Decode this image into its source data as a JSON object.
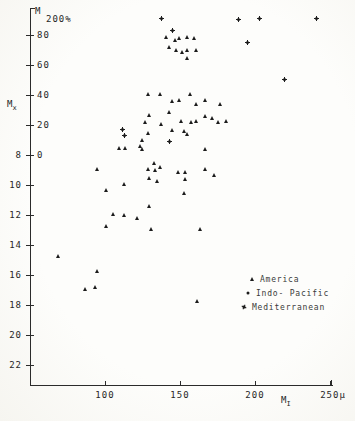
{
  "figure": {
    "title_m": "M",
    "title_pct": "200%",
    "y_outer_label_main": "M",
    "y_outer_label_sub": "x",
    "x_axis_label_main": "M",
    "x_axis_label_sub": "I"
  },
  "chart_data": {
    "type": "scatter",
    "title": "M 200%",
    "x_axis": {
      "label": "M I",
      "unit": "μ",
      "ticks": [
        {
          "value": 100,
          "label": "100"
        },
        {
          "value": 150,
          "label": "150"
        },
        {
          "value": 200,
          "label": "200"
        },
        {
          "value": 250,
          "label": "250μ"
        }
      ],
      "range": [
        50,
        252
      ]
    },
    "y_axis_inner": {
      "label": "M 200%",
      "ticks": [
        {
          "value": 80,
          "label": "80"
        },
        {
          "value": 60,
          "label": "60"
        },
        {
          "value": 40,
          "label": "40"
        },
        {
          "value": 20,
          "label": "20"
        },
        {
          "value": 0,
          "label": "0"
        }
      ]
    },
    "y_axis_outer": {
      "label": "M x",
      "ticks": [
        {
          "value": 8,
          "label": "8"
        },
        {
          "value": 10,
          "label": "10"
        },
        {
          "value": 12,
          "label": "12"
        },
        {
          "value": 14,
          "label": "14"
        },
        {
          "value": 16,
          "label": "16"
        },
        {
          "value": 18,
          "label": "18"
        },
        {
          "value": 20,
          "label": "20"
        },
        {
          "value": 22,
          "label": "22"
        }
      ]
    },
    "calibration": {
      "x0_px": 105,
      "x0_val": 100,
      "px_per_x": 1.5,
      "y0_px": 155,
      "y0_val": 0,
      "px_per_y": 1.5,
      "outer_y8_px": 155,
      "outer_px_per_unit": 15
    },
    "ink_color": "#1c1c1c",
    "legend": [
      {
        "name": "America",
        "marker": "triangle"
      },
      {
        "name": "Indo- Pacific",
        "marker": "dot"
      },
      {
        "name": "Mediterranean",
        "marker": "star"
      }
    ],
    "series": [
      {
        "name": "America",
        "marker": "triangle",
        "points": [
          [
            139,
            93
          ],
          [
            145,
            91
          ],
          [
            148,
            92
          ],
          [
            153,
            93
          ],
          [
            158,
            92
          ],
          [
            141,
            86
          ],
          [
            146,
            84
          ],
          [
            150,
            83
          ],
          [
            153,
            84
          ],
          [
            159,
            84
          ],
          [
            153,
            79
          ],
          [
            127,
            55
          ],
          [
            135,
            55
          ],
          [
            143,
            50
          ],
          [
            148,
            51
          ],
          [
            155,
            55
          ],
          [
            159,
            48
          ],
          [
            165,
            51
          ],
          [
            175,
            48
          ],
          [
            141,
            43
          ],
          [
            128,
            41
          ],
          [
            125,
            36
          ],
          [
            136,
            35
          ],
          [
            149,
            37
          ],
          [
            156,
            36
          ],
          [
            159,
            37
          ],
          [
            165,
            40
          ],
          [
            170,
            39
          ],
          [
            174,
            36
          ],
          [
            179,
            37
          ],
          [
            143,
            31
          ],
          [
            151,
            30
          ],
          [
            153,
            28
          ],
          [
            127,
            29
          ],
          [
            123,
            24
          ],
          [
            122,
            20
          ],
          [
            165,
            18
          ],
          [
            108,
            19
          ],
          [
            112,
            19
          ],
          [
            123,
            18
          ],
          [
            93,
            5
          ],
          [
            131,
            9
          ],
          [
            127,
            5
          ],
          [
            132,
            4
          ],
          [
            135,
            6
          ],
          [
            128,
            -1
          ],
          [
            133,
            -3
          ],
          [
            147,
            3
          ],
          [
            152,
            3
          ],
          [
            152,
            -2
          ],
          [
            165,
            5
          ],
          [
            171,
            1
          ],
          [
            111,
            -5
          ],
          [
            99,
            -9
          ],
          [
            151,
            -11
          ],
          [
            128,
            -20
          ],
          [
            104,
            -25
          ],
          [
            111,
            -26
          ],
          [
            120,
            -28
          ],
          [
            99,
            -33
          ],
          [
            129,
            -35
          ],
          [
            162,
            -35
          ],
          [
            67,
            -53
          ],
          [
            93,
            -63
          ],
          [
            92,
            -74
          ],
          [
            85,
            -75
          ],
          [
            160,
            -83
          ]
        ]
      },
      {
        "name": "Indo- Pacific",
        "marker": "dot",
        "points": [
          [
            162,
            90
          ],
          [
            142,
            87
          ],
          [
            154,
            82
          ],
          [
            122,
            79
          ],
          [
            139,
            77
          ],
          [
            153,
            81
          ],
          [
            172,
            78
          ],
          [
            126,
            75
          ],
          [
            141,
            74
          ],
          [
            145,
            62
          ],
          [
            151,
            61
          ],
          [
            162,
            61
          ],
          [
            139,
            54
          ],
          [
            145,
            49
          ],
          [
            161,
            47
          ],
          [
            167,
            51
          ],
          [
            181,
            46
          ],
          [
            198,
            45
          ],
          [
            198,
            43
          ],
          [
            211,
            36
          ],
          [
            139,
            45
          ],
          [
            130,
            35
          ],
          [
            139,
            37
          ],
          [
            153,
            38
          ],
          [
            162,
            39
          ],
          [
            166,
            37
          ],
          [
            172,
            38
          ],
          [
            185,
            37
          ],
          [
            145,
            31
          ],
          [
            148,
            32
          ],
          [
            156,
            31
          ],
          [
            129,
            27
          ],
          [
            128,
            22
          ],
          [
            141,
            25
          ],
          [
            148,
            25
          ],
          [
            125,
            17
          ],
          [
            119,
            3
          ],
          [
            133,
            10
          ],
          [
            129,
            3
          ],
          [
            131,
            0
          ],
          [
            145,
            2
          ],
          [
            149,
            2
          ],
          [
            151,
            -1
          ],
          [
            149,
            -9
          ],
          [
            153,
            -14
          ],
          [
            139,
            -15
          ],
          [
            109,
            -21
          ],
          [
            132,
            -19
          ],
          [
            122,
            -33
          ],
          [
            181,
            -34
          ],
          [
            153,
            -61
          ],
          [
            164,
            -81
          ],
          [
            119,
            -99
          ],
          [
            149,
            -122
          ],
          [
            102,
            -148
          ]
        ]
      },
      {
        "name": "Mediterranean",
        "marker": "star",
        "points": [
          [
            136,
            93
          ],
          [
            187,
            92
          ],
          [
            201,
            93
          ],
          [
            239,
            93
          ],
          [
            143,
            85
          ],
          [
            193,
            77
          ],
          [
            218,
            52
          ],
          [
            110,
            19
          ],
          [
            111,
            15
          ],
          [
            141,
            11
          ]
        ]
      }
    ]
  }
}
